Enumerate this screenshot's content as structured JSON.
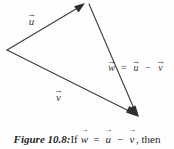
{
  "figure": {
    "caption_label": "Figure 10.8:",
    "caption_if": "If",
    "caption_then": ", then",
    "background_color": "#fefefe",
    "ink_color": "#3a3a3a"
  },
  "diagram": {
    "type": "vector-triangle",
    "vectors": [
      {
        "name": "u",
        "label": "u",
        "arrow_accent": "→",
        "from": [
          7,
          50
        ],
        "to": [
          84,
          4
        ],
        "arrowhead_at": "to",
        "label_position": [
          27,
          12
        ]
      },
      {
        "name": "v",
        "label": "v",
        "arrow_accent": "→",
        "from": [
          7,
          50
        ],
        "to": [
          138,
          117
        ],
        "arrowhead_at": "to",
        "label_position": [
          54,
          88
        ]
      },
      {
        "name": "w",
        "label": "w",
        "arrow_accent": "→",
        "from": [
          89,
          3
        ],
        "to": [
          138,
          117
        ],
        "arrowhead_at": "to",
        "label_position": [
          107,
          59
        ]
      }
    ],
    "equation": {
      "lhs": "w",
      "equals": "=",
      "rhs_first": "u",
      "minus": "−",
      "rhs_second": "v"
    }
  }
}
